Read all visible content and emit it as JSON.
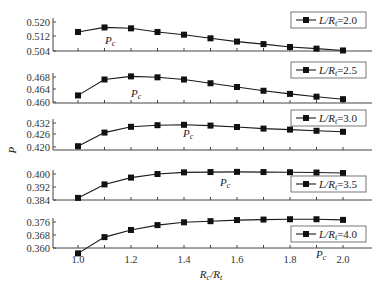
{
  "chart_data": {
    "type": "line",
    "title": "",
    "xlabel": "Rc/Rt",
    "ylabel": "P",
    "x": [
      1.0,
      1.1,
      1.2,
      1.3,
      1.4,
      1.5,
      1.6,
      1.7,
      1.8,
      1.9,
      2.0
    ],
    "x_ticks": [
      "1.0",
      "1.2",
      "1.4",
      "1.6",
      "1.8",
      "2.0"
    ],
    "xlim": [
      0.9,
      2.1
    ],
    "grid": false,
    "legend_position": "upper right of each panel",
    "panels": [
      {
        "name": "L/Rt=2.0",
        "legend": "L/Rt=2.0",
        "yticks": [
          "0.520",
          "0.512",
          "0.504"
        ],
        "ylim": [
          0.504,
          0.521
        ],
        "values": [
          0.5145,
          0.517,
          0.5165,
          0.5145,
          0.513,
          0.511,
          0.5092,
          0.5078,
          0.5062,
          0.5053,
          0.5043
        ],
        "annotation": "Pc"
      },
      {
        "name": "L/Rt=2.5",
        "legend": "L/Rt=2.5",
        "yticks": [
          "0.468",
          "0.464",
          "0.460"
        ],
        "ylim": [
          0.46,
          0.4695
        ],
        "values": [
          0.4621,
          0.4672,
          0.4682,
          0.4679,
          0.4672,
          0.466,
          0.4648,
          0.4636,
          0.4626,
          0.4617,
          0.4609
        ],
        "annotation": "Pc"
      },
      {
        "name": "L/Rt=3.0",
        "legend": "L/Rt=3.0",
        "yticks": [
          "0.432",
          "0.426",
          "0.420"
        ],
        "ylim": [
          0.4185,
          0.4335
        ],
        "values": [
          0.4204,
          0.4272,
          0.4301,
          0.4309,
          0.4311,
          0.4307,
          0.43,
          0.4292,
          0.4287,
          0.4281,
          0.4276
        ],
        "annotation": "Pc"
      },
      {
        "name": "L/Rt=3.5",
        "legend": "L/Rt=3.5",
        "yticks": [
          "0.400",
          "0.392",
          "0.384"
        ],
        "ylim": [
          0.384,
          0.4015
        ],
        "values": [
          0.3853,
          0.3936,
          0.3978,
          0.4,
          0.401,
          0.4012,
          0.4013,
          0.4012,
          0.4011,
          0.4009,
          0.4006
        ],
        "annotation": "Pc"
      },
      {
        "name": "L/Rt=4.0",
        "legend": "L/Rt=4.0",
        "yticks": [
          "0.376",
          "0.368",
          "0.360"
        ],
        "ylim": [
          0.36,
          0.3775
        ],
        "values": [
          0.3567,
          0.3667,
          0.3711,
          0.3741,
          0.3758,
          0.3765,
          0.3772,
          0.3775,
          0.3777,
          0.3777,
          0.3773
        ],
        "annotation": "Pc"
      }
    ]
  },
  "labels": {
    "ylabel": "P",
    "xlabel_main": "R",
    "xlabel_sub1": "c",
    "xlabel_slash": "/R",
    "xlabel_sub2": "t",
    "pc_main": "P",
    "pc_sub": "c",
    "legend_prefix": "L/R",
    "legend_sub": "t",
    "legend_values": [
      "=2.0",
      "=2.5",
      "=3.0",
      "=3.5",
      "=4.0"
    ]
  },
  "colors": {
    "line": "#1a1a1a",
    "marker": "#111111",
    "axis": "#444444",
    "legend_border": "#555555"
  }
}
